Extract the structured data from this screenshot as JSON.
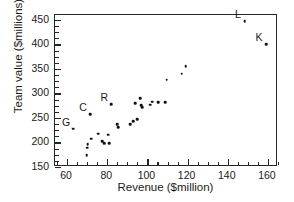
{
  "chart_data": {
    "type": "scatter",
    "title": "",
    "xlabel": "Revenue ($million)",
    "ylabel": "Team value ($millions)",
    "xlim": [
      54,
      165
    ],
    "ylim": [
      150,
      460
    ],
    "xticks": [
      60,
      80,
      100,
      120,
      140,
      160
    ],
    "yticks": [
      150,
      200,
      250,
      300,
      350,
      400,
      450
    ],
    "xtick_minor_step": 5,
    "ytick_minor_step": 12.5,
    "grid": false,
    "legend": null,
    "marker": "filled-circle",
    "marker_color": "#111111",
    "points": [
      {
        "label": "G",
        "x": 63.0,
        "y": 228
      },
      {
        "label": "",
        "x": 69.8,
        "y": 174
      },
      {
        "label": "",
        "x": 70.0,
        "y": 189
      },
      {
        "label": "",
        "x": 70.2,
        "y": 196
      },
      {
        "label": "C",
        "x": 71.5,
        "y": 258
      },
      {
        "label": "",
        "x": 72.0,
        "y": 208
      },
      {
        "label": "",
        "x": 75.5,
        "y": 218
      },
      {
        "label": "",
        "x": 77.5,
        "y": 203
      },
      {
        "label": "",
        "x": 78.5,
        "y": 199
      },
      {
        "label": "",
        "x": 80.5,
        "y": 216
      },
      {
        "label": "",
        "x": 81.0,
        "y": 199
      },
      {
        "label": "R",
        "x": 82.0,
        "y": 278
      },
      {
        "label": "",
        "x": 85.0,
        "y": 237
      },
      {
        "label": "",
        "x": 85.5,
        "y": 231
      },
      {
        "label": "",
        "x": 91.5,
        "y": 237
      },
      {
        "label": "",
        "x": 93.0,
        "y": 244
      },
      {
        "label": "",
        "x": 94.0,
        "y": 280
      },
      {
        "label": "",
        "x": 95.0,
        "y": 248
      },
      {
        "label": "",
        "x": 96.5,
        "y": 290
      },
      {
        "label": "",
        "x": 97.0,
        "y": 276
      },
      {
        "label": "",
        "x": 97.5,
        "y": 272
      },
      {
        "label": "",
        "x": 101.5,
        "y": 277
      },
      {
        "label": "",
        "x": 102.5,
        "y": 283
      },
      {
        "label": "",
        "x": 105.5,
        "y": 282
      },
      {
        "label": "",
        "x": 109.0,
        "y": 282
      },
      {
        "label": "",
        "x": 109.5,
        "y": 328
      },
      {
        "label": "",
        "x": 117.0,
        "y": 340
      },
      {
        "label": "",
        "x": 119.0,
        "y": 356
      },
      {
        "label": "L",
        "x": 148.5,
        "y": 447
      },
      {
        "label": "K",
        "x": 159.0,
        "y": 400
      }
    ]
  },
  "axis": {
    "ytick_labels": [
      "450",
      "400",
      "350",
      "300",
      "250",
      "200",
      "150"
    ],
    "xtick_labels": [
      "60",
      "80",
      "100",
      "120",
      "140",
      "160"
    ]
  }
}
